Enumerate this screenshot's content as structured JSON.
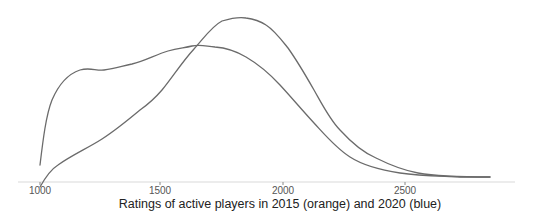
{
  "chart_data": {
    "type": "line",
    "title": "",
    "xlabel": "Ratings of active players in 2015 (orange) and 2020 (blue)",
    "ylabel": "",
    "xlim": [
      1000,
      2900
    ],
    "ylim": [
      0,
      1
    ],
    "grid": false,
    "legend": "none (encoded in x-axis label)",
    "x_ticks": [
      1000,
      1500,
      2000,
      2500
    ],
    "x_tick_labels": [
      "1000",
      "1500",
      "2000",
      "2500"
    ],
    "series": [
      {
        "name": "2015 (orange)",
        "color": "#6b6b6b",
        "x": [
          1000,
          1050,
          1150,
          1240,
          1360,
          1520,
          1610,
          1710,
          1820,
          1940,
          2060,
          2180,
          2310,
          2470,
          2630,
          2840
        ],
        "density": [
          0.12,
          0.56,
          0.76,
          0.76,
          0.79,
          0.89,
          0.92,
          0.91,
          0.86,
          0.75,
          0.52,
          0.28,
          0.14,
          0.07,
          0.04,
          0.03
        ]
      },
      {
        "name": "2020 (blue)",
        "color": "#6b6b6b",
        "x": [
          1000,
          1060,
          1240,
          1410,
          1500,
          1610,
          1710,
          1820,
          1900,
          1980,
          2110,
          2230,
          2360,
          2500,
          2640,
          2840
        ],
        "density": [
          -0.03,
          0.1,
          0.28,
          0.49,
          0.62,
          0.89,
          1.06,
          1.11,
          1.08,
          0.96,
          0.7,
          0.36,
          0.21,
          0.08,
          0.04,
          0.03
        ]
      }
    ]
  },
  "axis": {
    "x_title": "Ratings of active players in 2015 (orange) and 2020 (blue)",
    "ticks": [
      {
        "label": "1000",
        "x": 40
      },
      {
        "label": "1500",
        "x": 160
      },
      {
        "label": "2000",
        "x": 283
      },
      {
        "label": "2500",
        "x": 405
      }
    ]
  },
  "colors": {
    "curve": "#6b6b6b",
    "axis_line": "#e4e4e4",
    "tick": "#888888",
    "background": "#ffffff"
  }
}
